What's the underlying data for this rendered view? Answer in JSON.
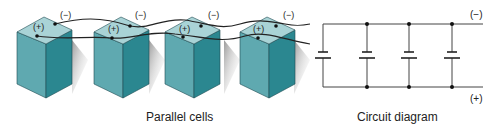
{
  "figure": {
    "left_panel": {
      "caption": "Parallel cells",
      "cells": [
        {
          "plus": "(+)",
          "minus": "(−)"
        },
        {
          "plus": "(+)",
          "minus": "(−)"
        },
        {
          "plus": "(+)",
          "minus": "(−)"
        },
        {
          "plus": "(+)",
          "minus": "(−)"
        }
      ]
    },
    "right_panel": {
      "caption": "Circuit diagram",
      "top_terminal": "(−)",
      "bottom_terminal": "(+)",
      "cell_count": 4
    },
    "colors": {
      "cell_front": "#5fa9b0",
      "cell_side": "#2b8790",
      "cell_top": "#a9d3d6",
      "wire": "#222222"
    }
  }
}
